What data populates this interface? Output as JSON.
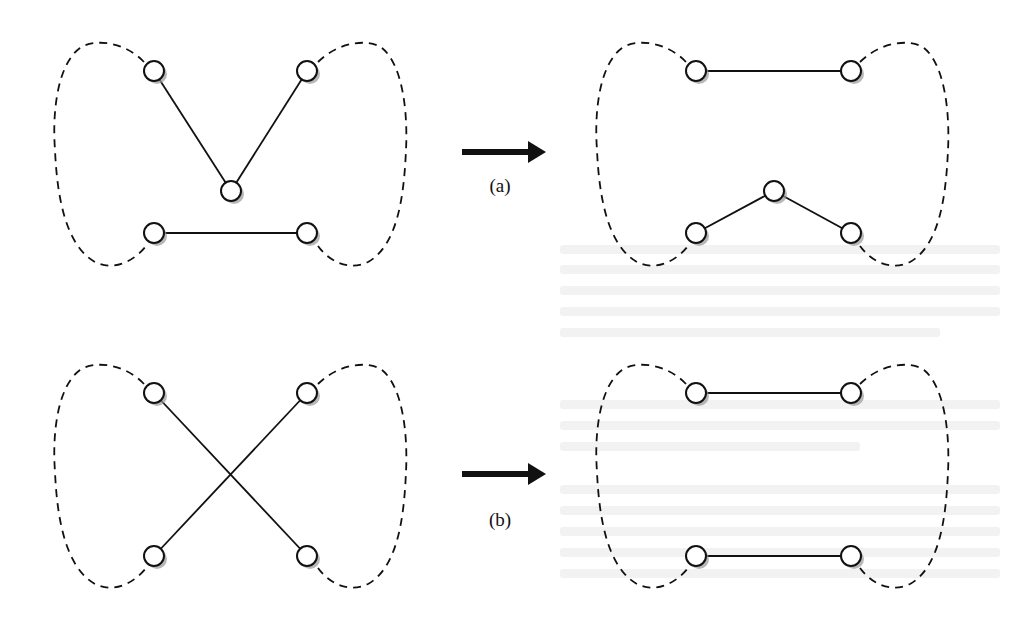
{
  "figure": {
    "colors": {
      "stroke": "#111111",
      "node_fill": "#ffffff",
      "node_shadow": "#9a9a9a",
      "background": "#ffffff"
    },
    "panels": [
      {
        "id": "a",
        "label": "(a)",
        "arrow": {
          "x1": 462,
          "x2": 540,
          "y": 152
        },
        "label_pos": {
          "x": 500,
          "y": 192
        },
        "before": {
          "nodes": [
            [
              154,
              71
            ],
            [
              307,
              71
            ],
            [
              231,
              191
            ],
            [
              154,
              233
            ],
            [
              307,
              233
            ]
          ],
          "edges": [
            [
              0,
              2
            ],
            [
              1,
              2
            ],
            [
              3,
              4
            ]
          ],
          "blob_offset": [
            0,
            0
          ]
        },
        "after": {
          "nodes": [
            [
              696,
              71
            ],
            [
              851,
              71
            ],
            [
              774,
              191
            ],
            [
              696,
              233
            ],
            [
              851,
              233
            ]
          ],
          "edges": [
            [
              0,
              1
            ],
            [
              3,
              2
            ],
            [
              2,
              4
            ]
          ],
          "blob_offset": [
            542,
            0
          ]
        }
      },
      {
        "id": "b",
        "label": "(b)",
        "arrow": {
          "x1": 462,
          "x2": 540,
          "y": 474
        },
        "label_pos": {
          "x": 500,
          "y": 526
        },
        "before": {
          "nodes": [
            [
              154,
              393
            ],
            [
              307,
              393
            ],
            [
              154,
              556
            ],
            [
              307,
              556
            ]
          ],
          "edges": [
            [
              0,
              3
            ],
            [
              1,
              2
            ]
          ],
          "blob_offset": [
            0,
            322
          ]
        },
        "after": {
          "nodes": [
            [
              696,
              393
            ],
            [
              851,
              393
            ],
            [
              696,
              556
            ],
            [
              851,
              556
            ]
          ],
          "edges": [
            [
              0,
              1
            ],
            [
              2,
              3
            ]
          ],
          "blob_offset": [
            542,
            322
          ]
        }
      }
    ]
  }
}
